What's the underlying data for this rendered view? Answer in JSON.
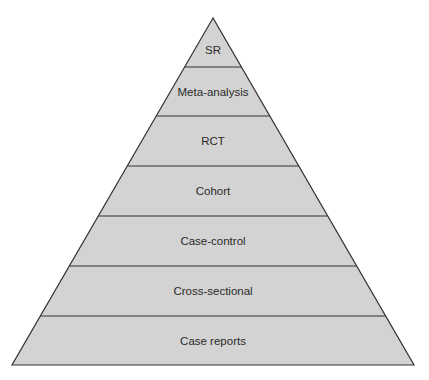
{
  "diagram": {
    "type": "pyramid",
    "fill_color": "#d3d3d3",
    "stroke_color": "#333333",
    "text_color": "#2a2a2a",
    "geometry": {
      "apex": [
        213,
        18
      ],
      "base_left": [
        12,
        365
      ],
      "base_right": [
        414,
        365
      ],
      "level_boundaries_y": [
        18,
        67,
        116,
        166,
        216,
        266,
        316,
        365
      ]
    },
    "levels": [
      {
        "label": "SR",
        "rank": 1
      },
      {
        "label": "Meta-analysis",
        "rank": 2
      },
      {
        "label": "RCT",
        "rank": 3
      },
      {
        "label": "Cohort",
        "rank": 4
      },
      {
        "label": "Case-control",
        "rank": 5
      },
      {
        "label": "Cross-sectional",
        "rank": 6
      },
      {
        "label": "Case reports",
        "rank": 7
      }
    ]
  }
}
